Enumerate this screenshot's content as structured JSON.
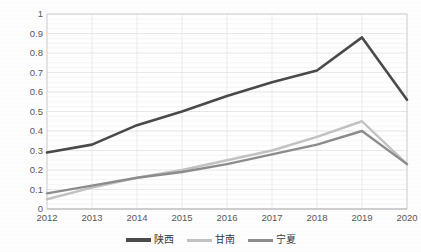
{
  "chart_data": {
    "type": "line",
    "title": "",
    "subtitle": "",
    "xlabel": "",
    "ylabel": "",
    "categories": [
      "2012",
      "2013",
      "2014",
      "2015",
      "2016",
      "2017",
      "2018",
      "2019",
      "2020"
    ],
    "x": [
      2012,
      2013,
      2014,
      2015,
      2016,
      2017,
      2018,
      2019,
      2020
    ],
    "ylim": [
      0,
      1
    ],
    "ytick_labels": [
      "0",
      "0.1",
      "0.2",
      "0.3",
      "0.4",
      "0.5",
      "0.6",
      "0.7",
      "0.8",
      "0.9",
      "1"
    ],
    "ytick_values": [
      0,
      0.1,
      0.2,
      0.3,
      0.4,
      0.5,
      0.6,
      0.7,
      0.8,
      0.9,
      1
    ],
    "grid": {
      "horizontal": true,
      "vertical": true,
      "color": "#e3e3e3"
    },
    "legend_position": "bottom",
    "series": [
      {
        "name": "陕西",
        "color": "#4a4a4a",
        "width": 2.6,
        "values": [
          0.29,
          0.33,
          0.43,
          0.5,
          0.58,
          0.65,
          0.71,
          0.88,
          0.56
        ]
      },
      {
        "name": "甘南",
        "color": "#c2c2c2",
        "width": 2.4,
        "values": [
          0.05,
          0.11,
          0.16,
          0.2,
          0.25,
          0.3,
          0.37,
          0.45,
          0.23
        ]
      },
      {
        "name": "宁夏",
        "color": "#8c8c8c",
        "width": 2.4,
        "values": [
          0.08,
          0.12,
          0.16,
          0.19,
          0.23,
          0.28,
          0.33,
          0.4,
          0.23
        ]
      }
    ]
  },
  "axes": {
    "plot_left": 47,
    "plot_right": 407,
    "plot_top": 14,
    "plot_bottom": 209,
    "frame_color": "#d0d0d0"
  }
}
